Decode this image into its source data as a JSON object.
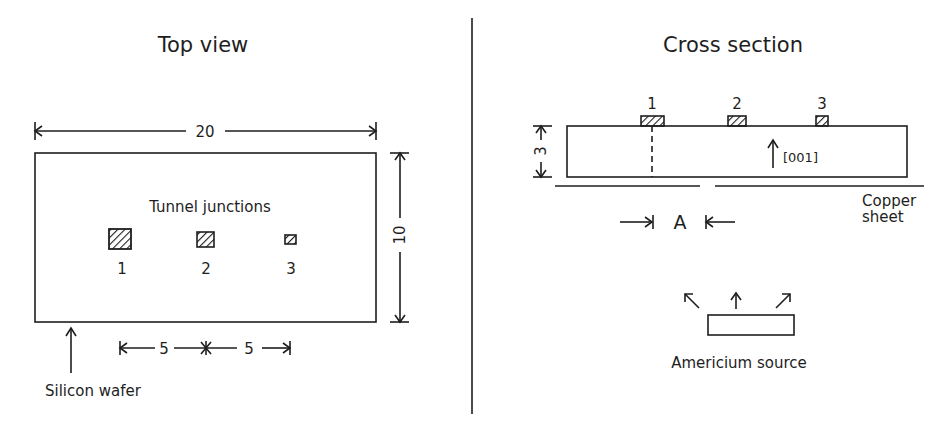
{
  "colors": {
    "ink": "#1e1e1e",
    "background": "#ffffff"
  },
  "top_view": {
    "title": "Top view",
    "wafer_width_label": "20",
    "wafer_height_label": "10",
    "junctions_label": "Tunnel junctions",
    "junctions": [
      {
        "label": "1",
        "size": "large"
      },
      {
        "label": "2",
        "size": "medium"
      },
      {
        "label": "3",
        "size": "small"
      }
    ],
    "spacing_labels": [
      "5",
      "5"
    ],
    "wafer_label": "Silicon wafer"
  },
  "cross_section": {
    "title": "Cross section",
    "pad_labels": [
      "1",
      "2",
      "3"
    ],
    "thickness_label": "3",
    "orientation_label": "[001]",
    "aperture_label": "A",
    "copper_label_line1": "Copper",
    "copper_label_line2": "sheet",
    "source_label": "Americium source"
  }
}
